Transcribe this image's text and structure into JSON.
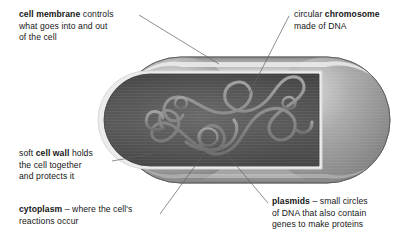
{
  "diagram": {
    "background_color": "#ffffff",
    "text_color": "#161616",
    "leader_color": "#5a5a5a"
  },
  "labels": [
    {
      "id": "cell-membrane",
      "bold_term": "cell membrane",
      "lines": [
        " controls",
        "what goes into and out",
        "of the cell"
      ],
      "full_text": "cell membrane controls what goes into and out of the cell",
      "position": "top-left"
    },
    {
      "id": "chromosome",
      "lead_text": "circular ",
      "bold_term": "chromosome",
      "lines": [
        "made of DNA"
      ],
      "full_text": "circular chromosome made of DNA",
      "position": "top-right"
    },
    {
      "id": "cell-wall",
      "lead_text": "soft ",
      "bold_term": "cell wall",
      "lines": [
        " holds",
        "the cell together",
        "and protects it"
      ],
      "full_text": "soft cell wall holds the cell together and protects it",
      "position": "middle-left"
    },
    {
      "id": "cytoplasm",
      "bold_term": "cytoplasm",
      "lines": [
        " – where the cell's",
        "reactions occur"
      ],
      "full_text": "cytoplasm – where the cell's reactions occur",
      "position": "bottom-left"
    },
    {
      "id": "plasmids",
      "bold_term": "plasmids",
      "lines": [
        " – small circles",
        "of DNA that also contain",
        "genes to make proteins"
      ],
      "full_text": "plasmids – small circles of DNA that also contain genes to make proteins",
      "position": "bottom-right"
    }
  ],
  "label_text": {
    "membrane_bold": "cell membrane",
    "membrane_l1": " controls",
    "membrane_l2": "what goes into and out",
    "membrane_l3": "of the cell",
    "chromosome_pre": "circular ",
    "chromosome_bold": "chromosome",
    "chromosome_l2": "made of DNA",
    "wall_pre": "soft ",
    "wall_bold": "cell wall",
    "wall_l1": " holds",
    "wall_l2": "the cell together",
    "wall_l3": "and protects it",
    "cytoplasm_bold": "cytoplasm",
    "cytoplasm_l1": " – where the cell's",
    "cytoplasm_l2": "reactions occur",
    "plasmids_bold": "plasmids",
    "plasmids_l1": " – small circles",
    "plasmids_l2": "of DNA that also contain",
    "plasmids_l3": "genes to make proteins"
  },
  "cell": {
    "shape": "capsule",
    "bounds": {
      "x": 118,
      "y": 57,
      "width": 272,
      "height": 126
    },
    "wall_color": "#9a9a9a",
    "wall_highlight": "#f2f2f2",
    "cytoplasm_color": "#4c4c4c",
    "membrane_rim_color": "#e8e8e8",
    "chromosome_color": "#8f8f8f",
    "plasmid_count": 3,
    "parts": [
      {
        "name": "cell-wall",
        "description": "outer grey capsule with glossy highlight"
      },
      {
        "name": "cell-membrane",
        "description": "bright thin rim inside the wall"
      },
      {
        "name": "cytoplasm",
        "description": "dark grey interior of the cut-away cell"
      },
      {
        "name": "circular-chromosome",
        "description": "long tangled looped DNA strand"
      },
      {
        "name": "plasmids",
        "description": "three small DNA circles"
      }
    ]
  },
  "leaders": [
    {
      "name": "membrane-leader",
      "from": [
        139,
        15
      ],
      "to": [
        219,
        64
      ]
    },
    {
      "name": "chromosome-leader",
      "from": [
        289,
        16
      ],
      "to": [
        244,
        104
      ]
    },
    {
      "name": "wall-leader",
      "from": [
        112,
        161
      ],
      "to": [
        152,
        154
      ]
    },
    {
      "name": "cytoplasm-leader",
      "from": [
        160,
        214
      ],
      "to": [
        206,
        151
      ]
    },
    {
      "name": "plasmids-leader",
      "from": [
        268,
        203
      ],
      "to": [
        214,
        139
      ]
    }
  ]
}
